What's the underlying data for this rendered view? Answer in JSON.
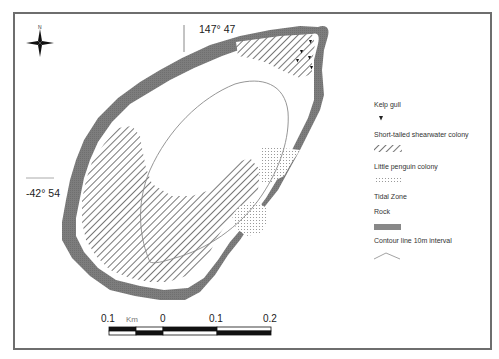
{
  "map": {
    "north_label": "N",
    "longitude_label": "147° 47",
    "latitude_label": "-42° 54"
  },
  "legend": {
    "items": [
      {
        "label": "Kelp gull",
        "symbol": "black-triangle"
      },
      {
        "label": "Short-tailed shearwater colony",
        "symbol": "diagonal-hatch"
      },
      {
        "label": "Little penguin colony",
        "symbol": "stipple-dots"
      },
      {
        "label": "Tidal Zone",
        "symbol": "none"
      },
      {
        "label": "Rock",
        "symbol": "grey-fill"
      },
      {
        "label": "Contour line 10m interval",
        "symbol": "zigzag-line"
      }
    ]
  },
  "scale_bar": {
    "unit": "Km",
    "ticks": [
      "0.1",
      "0",
      "0.1",
      "0.2"
    ]
  },
  "colors": {
    "rock": "#7a7a7a",
    "hatch": "#555555",
    "frame": "#6e6e6e",
    "contour": "#8a8a8a"
  }
}
